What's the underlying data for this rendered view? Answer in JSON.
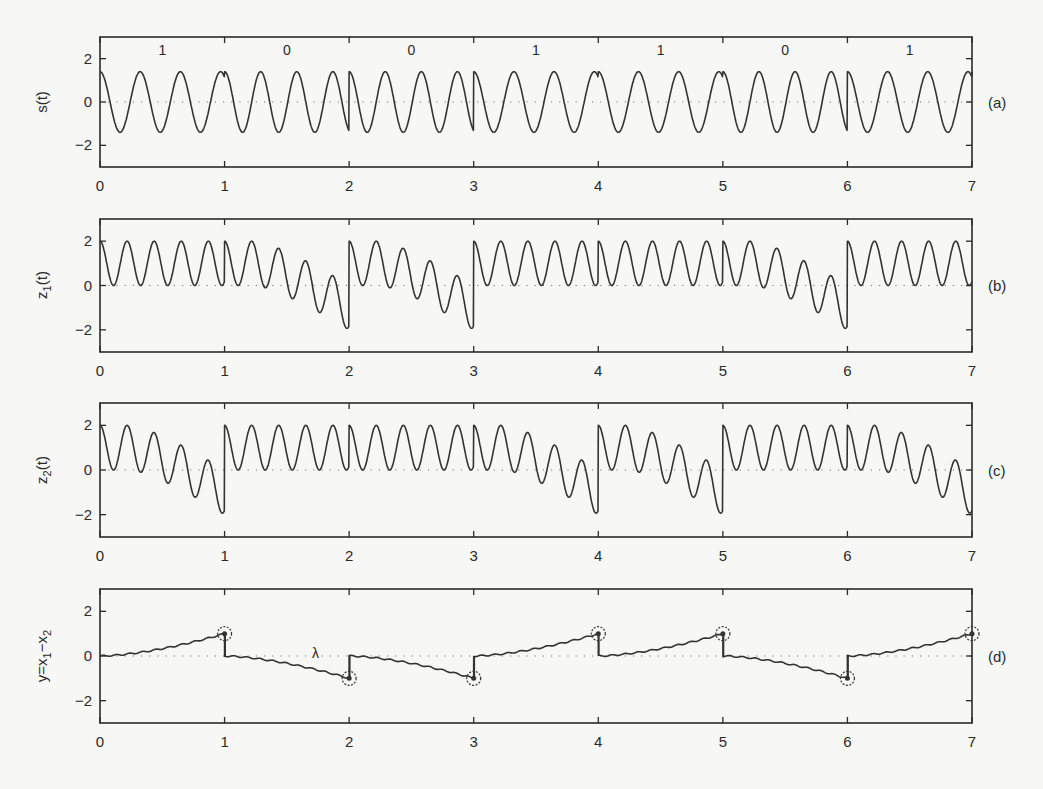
{
  "chart_data": [
    {
      "type": "line",
      "panel": "(a)",
      "title": "",
      "xlabel": "",
      "ylabel": "s(t)",
      "xlim": [
        0,
        7
      ],
      "ylim": [
        -3,
        3
      ],
      "xticks": [
        0,
        1,
        2,
        3,
        4,
        5,
        6,
        7
      ],
      "yticks": [
        -2,
        0,
        2
      ],
      "zero_reference_line": "dotted",
      "bit_labels": [
        "1",
        "0",
        "0",
        "1",
        "1",
        "0",
        "1"
      ],
      "bits": [
        1,
        0,
        0,
        1,
        1,
        0,
        1
      ],
      "series": [
        {
          "name": "s(t)",
          "kind": "FSK sinusoid",
          "amplitude": 1.4,
          "freq_bit1": 3.1,
          "freq_bit0": 3.45,
          "phase_jumps_at": [
            2,
            3,
            6
          ]
        }
      ]
    },
    {
      "type": "line",
      "panel": "(b)",
      "xlabel": "",
      "ylabel": "z_1(t)",
      "xlim": [
        0,
        7
      ],
      "ylim": [
        -3,
        3
      ],
      "xticks": [
        0,
        1,
        2,
        3,
        4,
        5,
        6,
        7
      ],
      "yticks": [
        -2,
        0,
        2
      ],
      "zero_reference_line": "dotted",
      "series": [
        {
          "name": "z_1(t)",
          "oscillation_amplitude": 1.0,
          "offset": 1.0,
          "peak": 2,
          "min_per_bit": [
            0,
            -2,
            -2,
            0,
            0,
            -2,
            0
          ],
          "reset_at": [
            2,
            3,
            6
          ]
        }
      ]
    },
    {
      "type": "line",
      "panel": "(c)",
      "xlabel": "",
      "ylabel": "z_2(t)",
      "xlim": [
        0,
        7
      ],
      "ylim": [
        -3,
        3
      ],
      "xticks": [
        0,
        1,
        2,
        3,
        4,
        5,
        6,
        7
      ],
      "yticks": [
        -2,
        0,
        2
      ],
      "zero_reference_line": "dotted",
      "series": [
        {
          "name": "z_2(t)",
          "oscillation_amplitude": 1.0,
          "offset": 1.0,
          "peak": 2,
          "min_per_bit": [
            -2,
            0,
            0,
            -2,
            -2,
            0,
            -2
          ],
          "reset_at": [
            1,
            4,
            5
          ]
        }
      ]
    },
    {
      "type": "line",
      "panel": "(d)",
      "xlabel": "",
      "ylabel": "y=x_1-x_2",
      "xlim": [
        0,
        7
      ],
      "ylim": [
        -3,
        3
      ],
      "xticks": [
        0,
        1,
        2,
        3,
        4,
        5,
        6,
        7
      ],
      "yticks": [
        -2,
        0,
        2
      ],
      "zero_reference_line": "dotted",
      "annotation": "λ",
      "annotation_position": [
        1.9,
        0.35
      ],
      "series": [
        {
          "name": "y",
          "end_of_bit_values": [
            1,
            -1,
            -1,
            1,
            1,
            -1,
            1
          ]
        }
      ],
      "markers": [
        {
          "t": 1,
          "y": 1
        },
        {
          "t": 2,
          "y": -1
        },
        {
          "t": 3,
          "y": -1
        },
        {
          "t": 4,
          "y": 1
        },
        {
          "t": 5,
          "y": 1
        },
        {
          "t": 6,
          "y": -1
        },
        {
          "t": 7,
          "y": 1
        }
      ]
    }
  ],
  "panels": [
    {
      "id": "a",
      "tag": "(a)",
      "ylabel": "s(t)"
    },
    {
      "id": "b",
      "tag": "(b)",
      "ylabel": "z",
      "ylabel_sub": "1",
      "ylabel_suffix": "(t)"
    },
    {
      "id": "c",
      "tag": "(c)",
      "ylabel": "z",
      "ylabel_sub": "2",
      "ylabel_suffix": "(t)"
    },
    {
      "id": "d",
      "tag": "(d)",
      "ylabel": "y=x",
      "ylabel_sub": "1",
      "ylabel_mid": "−x",
      "ylabel_sub2": "2"
    }
  ],
  "axis": {
    "xtick_labels": [
      "0",
      "1",
      "2",
      "3",
      "4",
      "5",
      "6",
      "7"
    ],
    "ytick_labels": [
      "2",
      "0",
      "−2"
    ]
  },
  "lambda_label": "λ"
}
